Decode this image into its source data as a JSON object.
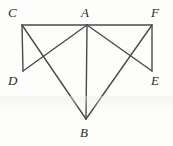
{
  "figure": {
    "kind": "geometry-line-diagram",
    "background_color": "#fdfdfc",
    "stroke_color": "#4a4a4a",
    "label_color": "#2b2b2b",
    "width": 173,
    "height": 146,
    "vertices": [
      {
        "id": "C",
        "label": "C",
        "x": 22,
        "y": 25,
        "label_x": 8,
        "label_y": 6
      },
      {
        "id": "A",
        "label": "A",
        "x": 87,
        "y": 25,
        "label_x": 81,
        "label_y": 6
      },
      {
        "id": "F",
        "label": "F",
        "x": 152,
        "y": 25,
        "label_x": 151,
        "label_y": 6
      },
      {
        "id": "D",
        "label": "D",
        "x": 23,
        "y": 71,
        "label_x": 8,
        "label_y": 74
      },
      {
        "id": "E",
        "label": "E",
        "x": 152,
        "y": 71,
        "label_x": 151,
        "label_y": 74
      },
      {
        "id": "B",
        "label": "B",
        "x": 86,
        "y": 119,
        "label_x": 80,
        "label_y": 126
      }
    ],
    "segments": [
      {
        "name": "segment-CA",
        "from": "C",
        "to": "A"
      },
      {
        "name": "segment-AF",
        "from": "A",
        "to": "F"
      },
      {
        "name": "segment-CD",
        "from": "C",
        "to": "D"
      },
      {
        "name": "segment-FE",
        "from": "F",
        "to": "E"
      },
      {
        "name": "segment-DA",
        "from": "D",
        "to": "A"
      },
      {
        "name": "segment-AE",
        "from": "A",
        "to": "E"
      },
      {
        "name": "segment-CB",
        "from": "C",
        "to": "B"
      },
      {
        "name": "segment-FB",
        "from": "F",
        "to": "B"
      },
      {
        "name": "segment-AB",
        "from": "A",
        "to": "B"
      }
    ],
    "intersections": [
      {
        "name": "intersection-left",
        "x": 42,
        "y": 60
      },
      {
        "name": "intersection-right",
        "x": 130,
        "y": 61
      }
    ]
  }
}
